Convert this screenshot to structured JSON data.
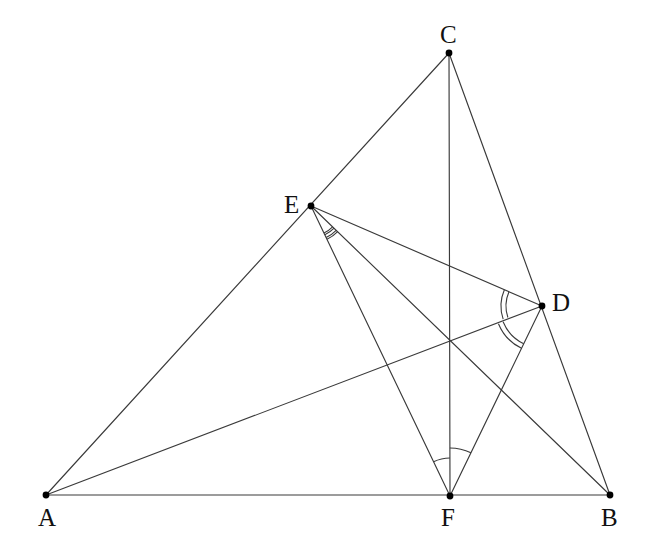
{
  "figure": {
    "kind": "euclidean-geometry-diagram",
    "background_color": "#ffffff",
    "line_color": "#3a3a3a",
    "point_color": "#000000",
    "label_color": "#111111",
    "canvas": {
      "width": 651,
      "height": 550
    }
  },
  "points": [
    {
      "id": "A",
      "label": "A",
      "x": 46,
      "y": 495,
      "label_x": 38,
      "label_y": 505,
      "dot_r": 3.4
    },
    {
      "id": "B",
      "label": "B",
      "x": 610,
      "y": 495,
      "label_x": 601,
      "label_y": 505,
      "dot_r": 3.4
    },
    {
      "id": "C",
      "label": "C",
      "x": 449,
      "y": 53,
      "label_x": 440,
      "label_y": 22,
      "dot_r": 3.4
    },
    {
      "id": "D",
      "label": "D",
      "x": 542,
      "y": 306,
      "label_x": 552,
      "label_y": 290,
      "dot_r": 3.4
    },
    {
      "id": "E",
      "label": "E",
      "x": 311,
      "y": 206,
      "label_x": 284,
      "label_y": 192,
      "dot_r": 3.4
    },
    {
      "id": "F",
      "label": "F",
      "x": 450,
      "y": 496,
      "label_x": 441,
      "label_y": 505,
      "dot_r": 3.4
    }
  ],
  "segments": [
    {
      "name": "segment-AB",
      "from": "A",
      "to": "B"
    },
    {
      "name": "segment-AC",
      "from": "A",
      "to": "C"
    },
    {
      "name": "segment-CB",
      "from": "C",
      "to": "B"
    },
    {
      "name": "segment-CF",
      "from": "C",
      "to": "F"
    },
    {
      "name": "segment-AD",
      "from": "A",
      "to": "D"
    },
    {
      "name": "segment-ED",
      "from": "E",
      "to": "D"
    },
    {
      "name": "segment-EF",
      "from": "E",
      "to": "F"
    },
    {
      "name": "segment-EB",
      "from": "E",
      "to": "B"
    },
    {
      "name": "segment-DF",
      "from": "D",
      "to": "F"
    }
  ],
  "angle_marks": [
    {
      "name": "angle-mark-E-inner",
      "vertex": "E",
      "ray_from": "F",
      "ray_to": "D",
      "radius": 32,
      "ticks": 2,
      "tick_gap": 5,
      "portion": [
        0.0,
        0.5
      ]
    },
    {
      "name": "angle-mark-E-outer",
      "vertex": "E",
      "ray_from": "B",
      "ray_to": "F",
      "radius": 30,
      "ticks": 2,
      "tick_gap": 5,
      "portion": [
        0.0,
        1.0
      ]
    },
    {
      "name": "angle-mark-D-upper",
      "vertex": "D",
      "ray_from": "E",
      "ray_to": "F",
      "radius": 36,
      "ticks": 2,
      "tick_gap": 5,
      "portion": [
        0.0,
        0.48
      ]
    },
    {
      "name": "angle-mark-D-lower",
      "vertex": "D",
      "ray_from": "E",
      "ray_to": "F",
      "radius": 42,
      "ticks": 2,
      "tick_gap": 5,
      "portion": [
        0.52,
        1.0
      ]
    },
    {
      "name": "angle-mark-F-inner",
      "vertex": "F",
      "ray_from": "E",
      "ray_to": "C",
      "radius": 38,
      "ticks": 1,
      "tick_gap": 0,
      "portion": [
        0.0,
        1.0
      ]
    },
    {
      "name": "angle-mark-F-outer",
      "vertex": "F",
      "ray_from": "C",
      "ray_to": "D",
      "radius": 48,
      "ticks": 1,
      "tick_gap": 0,
      "portion": [
        0.0,
        1.0
      ]
    }
  ],
  "labels": {
    "A": "A",
    "B": "B",
    "C": "C",
    "D": "D",
    "E": "E",
    "F": "F"
  }
}
